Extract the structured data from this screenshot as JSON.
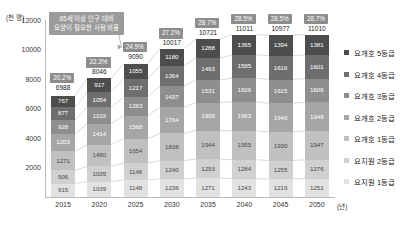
{
  "chart_data": {
    "type": "bar",
    "stacked": true,
    "title": "",
    "xlabel": "(년)",
    "ylabel": "(천 명)",
    "ylim": [
      0,
      12000
    ],
    "yticks": [
      0,
      2000,
      4000,
      6000,
      8000,
      10000,
      12000
    ],
    "ytick_labels": [
      "0",
      "2000",
      "4000",
      "6000",
      "8000",
      "10000",
      "12000"
    ],
    "grid": false,
    "legend_position": "right",
    "categories": [
      "2015",
      "2020",
      "2025",
      "2030",
      "2035",
      "2040",
      "2045",
      "2050"
    ],
    "series": [
      {
        "name": "요지원 1등급",
        "color": "#e2e2e2",
        "text_color": "dark",
        "values": [
          915,
          1039,
          1148,
          1236,
          1271,
          1243,
          1219,
          1251
        ]
      },
      {
        "name": "요지원 2등급",
        "color": "#d0d0d0",
        "text_color": "dark",
        "values": [
          906,
          1035,
          1146,
          1240,
          1293,
          1284,
          1255,
          1276
        ]
      },
      {
        "name": "요개호 1등급",
        "color": "#c0c0c0",
        "text_color": "dark",
        "values": [
          1271,
          1480,
          1654,
          1838,
          1944,
          1955,
          1930,
          1947
        ]
      },
      {
        "name": "요개호 2등급",
        "color": "#a6a6a6",
        "text_color": "light",
        "values": [
          1203,
          1414,
          1568,
          1764,
          1900,
          1963,
          1949,
          1948
        ]
      },
      {
        "name": "요개호 3등급",
        "color": "#8e8e8e",
        "text_color": "light",
        "values": [
          928,
          1103,
          1263,
          1437,
          1531,
          1606,
          1615,
          1606
        ]
      },
      {
        "name": "요개호 4등급",
        "color": "#6e6e6e",
        "text_color": "light",
        "values": [
          877,
          1054,
          1217,
          1364,
          1493,
          1585,
          1616,
          1601
        ]
      },
      {
        "name": "요개호 5등급",
        "color": "#4d4d4d",
        "text_color": "light",
        "values": [
          767,
          917,
          1055,
          1180,
          1288,
          1365,
          1394,
          1381
        ]
      }
    ],
    "totals": [
      6988,
      8046,
      9090,
      10017,
      10721,
      11011,
      10977,
      11010
    ],
    "percent_labels": [
      "20.2%",
      "22.3%",
      "24.9%",
      "27.2%",
      "28.7%",
      "28.5%",
      "28.5%",
      "28.7%"
    ],
    "annotation": "65세 이상 인구 대비\n요양이 필요한 사람 비율"
  },
  "legend": {
    "items": [
      {
        "label": "요개호 5등급",
        "color": "#4d4d4d"
      },
      {
        "label": "요개호 4등급",
        "color": "#6e6e6e"
      },
      {
        "label": "요개호 3등급",
        "color": "#8e8e8e"
      },
      {
        "label": "요개호 2등급",
        "color": "#a6a6a6"
      },
      {
        "label": "요개호 1등급",
        "color": "#c0c0c0"
      },
      {
        "label": "요지원 2등급",
        "color": "#d0d0d0"
      },
      {
        "label": "요지원 1등급",
        "color": "#e2e2e2"
      }
    ]
  }
}
